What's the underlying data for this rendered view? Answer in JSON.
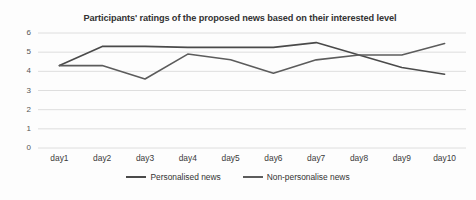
{
  "chart_data": {
    "type": "line",
    "title": "Participants' ratings of the proposed news based on their interested level",
    "xlabel": "",
    "ylabel": "",
    "categories": [
      "day1",
      "day2",
      "day3",
      "day4",
      "day5",
      "day6",
      "day7",
      "day8",
      "day9",
      "day10"
    ],
    "series": [
      {
        "name": "Personalised news",
        "color": "#4a4a4a",
        "values": [
          4.3,
          5.3,
          5.3,
          5.25,
          5.25,
          5.25,
          5.5,
          4.85,
          4.2,
          3.85
        ]
      },
      {
        "name": "Non-personalise news",
        "color": "#5c5c5c",
        "values": [
          4.3,
          4.3,
          3.6,
          4.9,
          4.6,
          3.9,
          4.6,
          4.85,
          4.85,
          5.45
        ]
      }
    ],
    "ylim": [
      0,
      6
    ],
    "y_ticks": [
      "0",
      "1",
      "2",
      "3",
      "4",
      "5",
      "6"
    ],
    "grid": true,
    "legend_position": "bottom"
  },
  "legend": {
    "items": [
      {
        "label": "Personalised news",
        "color": "#4a4a4a"
      },
      {
        "label": "Non-personalise news",
        "color": "#5c5c5c"
      }
    ]
  },
  "axes": {
    "grid_color": "#d6d6d6",
    "axis_color": "#b8b8b8"
  }
}
